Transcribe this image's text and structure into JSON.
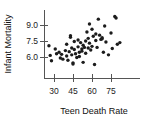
{
  "chart_data": {
    "type": "scatter",
    "title": "",
    "xlabel": "Teen Death Rate",
    "ylabel": "Infant Mortality",
    "xticks": [
      30,
      45,
      60,
      75
    ],
    "yticks": [
      6.0,
      7.5,
      9.0
    ],
    "xtick_labels": [
      "30",
      "45",
      "60",
      "75"
    ],
    "ytick_labels": [
      "6.0",
      "7.5",
      "9.0"
    ],
    "xlim": [
      22,
      92
    ],
    "ylim": [
      5.0,
      10.0
    ],
    "grid": false,
    "legend": null,
    "marker": "filled-circle",
    "marker_color": "#1c1c1c",
    "points": [
      {
        "x": 26,
        "y": 7.05
      },
      {
        "x": 27,
        "y": 6.15
      },
      {
        "x": 28,
        "y": 5.65
      },
      {
        "x": 31,
        "y": 6.75
      },
      {
        "x": 32,
        "y": 6.3
      },
      {
        "x": 34,
        "y": 6.45
      },
      {
        "x": 35,
        "y": 5.9
      },
      {
        "x": 36,
        "y": 6.25
      },
      {
        "x": 37,
        "y": 5.8
      },
      {
        "x": 39,
        "y": 6.6
      },
      {
        "x": 40,
        "y": 6.1
      },
      {
        "x": 40,
        "y": 7.2
      },
      {
        "x": 41,
        "y": 5.7
      },
      {
        "x": 42,
        "y": 6.5
      },
      {
        "x": 43,
        "y": 8.0
      },
      {
        "x": 43,
        "y": 7.85
      },
      {
        "x": 44,
        "y": 6.85
      },
      {
        "x": 44,
        "y": 6.2
      },
      {
        "x": 45,
        "y": 5.45
      },
      {
        "x": 45,
        "y": 5.35
      },
      {
        "x": 46,
        "y": 7.45
      },
      {
        "x": 46,
        "y": 6.7
      },
      {
        "x": 47,
        "y": 6.3
      },
      {
        "x": 48,
        "y": 5.95
      },
      {
        "x": 49,
        "y": 7.6
      },
      {
        "x": 49,
        "y": 6.95
      },
      {
        "x": 50,
        "y": 6.45
      },
      {
        "x": 50,
        "y": 6.05
      },
      {
        "x": 51,
        "y": 7.35
      },
      {
        "x": 52,
        "y": 6.75
      },
      {
        "x": 52,
        "y": 6.55
      },
      {
        "x": 53,
        "y": 7.1
      },
      {
        "x": 53,
        "y": 5.5
      },
      {
        "x": 54,
        "y": 6.9
      },
      {
        "x": 55,
        "y": 7.5
      },
      {
        "x": 55,
        "y": 6.35
      },
      {
        "x": 56,
        "y": 8.35
      },
      {
        "x": 57,
        "y": 7.75
      },
      {
        "x": 57,
        "y": 6.85
      },
      {
        "x": 58,
        "y": 9.1
      },
      {
        "x": 58,
        "y": 7.3
      },
      {
        "x": 59,
        "y": 6.65
      },
      {
        "x": 60,
        "y": 8.6
      },
      {
        "x": 60,
        "y": 7.0
      },
      {
        "x": 61,
        "y": 7.95
      },
      {
        "x": 62,
        "y": 5.3
      },
      {
        "x": 63,
        "y": 8.15
      },
      {
        "x": 63,
        "y": 7.55
      },
      {
        "x": 64,
        "y": 6.9
      },
      {
        "x": 65,
        "y": 9.55
      },
      {
        "x": 66,
        "y": 8.05
      },
      {
        "x": 67,
        "y": 7.65
      },
      {
        "x": 68,
        "y": 7.8
      },
      {
        "x": 68,
        "y": 7.7
      },
      {
        "x": 69,
        "y": 6.45
      },
      {
        "x": 70,
        "y": 8.9
      },
      {
        "x": 71,
        "y": 7.4
      },
      {
        "x": 73,
        "y": 6.2
      },
      {
        "x": 75,
        "y": 8.25
      },
      {
        "x": 76,
        "y": 6.8
      },
      {
        "x": 78,
        "y": 9.8
      },
      {
        "x": 79,
        "y": 9.65
      },
      {
        "x": 80,
        "y": 7.2
      },
      {
        "x": 82,
        "y": 7.35
      }
    ]
  }
}
